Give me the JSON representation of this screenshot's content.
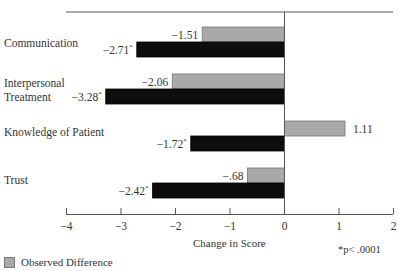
{
  "chart_data": {
    "type": "bar",
    "orientation": "horizontal",
    "title": "",
    "xlabel": "Change in Score",
    "ylabel": "",
    "xlim": [
      -4,
      2
    ],
    "xticks": [
      -4,
      -3,
      -2,
      -1,
      0,
      1,
      2
    ],
    "xtick_labels": [
      "−4",
      "−3",
      "−2",
      "−1",
      "0",
      "1",
      "2"
    ],
    "categories": [
      "Communication",
      "Interpersonal Treatment",
      "Knowledge of Patient",
      "Trust"
    ],
    "category_lines": [
      [
        "Communication"
      ],
      [
        "Interpersonal",
        "Treatment"
      ],
      [
        "Knowledge of Patient"
      ],
      [
        "Trust"
      ]
    ],
    "series": [
      {
        "name": "Observed Difference",
        "color": "#a9a9a9",
        "values": [
          -1.51,
          -2.06,
          1.11,
          -0.68
        ],
        "labels": [
          "−1.51",
          "−2.06",
          "1.11",
          "−.68"
        ],
        "significant": [
          false,
          false,
          false,
          false
        ]
      },
      {
        "name": "",
        "color": "#0d0d0d",
        "values": [
          -2.71,
          -3.28,
          -1.72,
          -2.42
        ],
        "labels": [
          "−2.71",
          "−3.28",
          "−1.72",
          "−2.42"
        ],
        "significant": [
          true,
          true,
          true,
          true
        ]
      }
    ],
    "annotations": [
      "*p< .0001"
    ],
    "grid": false,
    "legend_position": "bottom-left"
  },
  "legend": {
    "items": [
      {
        "label": "Observed Difference",
        "color": "#a9a9a9"
      }
    ]
  },
  "footnote": "*p< .0001",
  "axis_title": "Change in Score"
}
